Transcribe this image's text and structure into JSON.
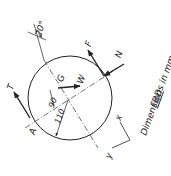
{
  "diagram": {
    "title": "FBD",
    "note": "Dimensions in mm",
    "labels": {
      "T": "T",
      "F": "F",
      "N": "N",
      "W": "W",
      "G": "G",
      "A": "A",
      "angle": "20°",
      "dim_90": "90",
      "dim_110": "110",
      "x_axis": "x",
      "y_axis": "y"
    },
    "colors": {
      "ink": "#222222",
      "background": "#ffffff"
    }
  }
}
